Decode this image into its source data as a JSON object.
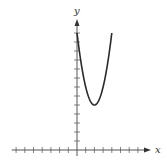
{
  "chart_data": {
    "type": "line",
    "title": "",
    "xlabel": "x",
    "ylabel": "y",
    "function": "y = 2(x - 2)^2 + 5",
    "x": [
      0,
      0.5,
      1,
      1.5,
      2,
      2.5,
      3,
      3.5,
      4
    ],
    "series": [
      {
        "name": "parabola",
        "values": [
          13,
          9.5,
          7,
          5.5,
          5,
          5.5,
          7,
          9.5,
          13
        ]
      }
    ],
    "vertex": [
      2,
      5
    ],
    "xlim": [
      -7.5,
      8
    ],
    "ylim": [
      0,
      14.5
    ],
    "x_ticks": [
      -7,
      -6,
      -5,
      -4,
      -3,
      -2,
      -1,
      1,
      2,
      3,
      4,
      5,
      6,
      7
    ],
    "y_ticks": [
      1,
      2,
      3,
      4,
      5,
      6,
      7,
      8,
      9,
      10,
      11,
      12,
      13
    ],
    "tick_labels_shown": false,
    "grid": false,
    "legend": null,
    "colors": {
      "axis": "#555555",
      "curve": "#2a2a2a"
    }
  }
}
